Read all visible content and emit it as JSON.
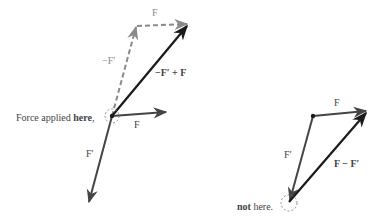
{
  "diagram": {
    "colors": {
      "black_arrow": "#1a1a1a",
      "dark_arrow": "#444444",
      "dashed_arrow": "#8a8a8a",
      "text": "#333333"
    },
    "left": {
      "caption_prefix": "Force applied ",
      "caption_bold": "here",
      "caption_suffix": ",",
      "labels": {
        "dashed_F": "F",
        "dashed_negFprime": "−F′",
        "sum": "−F′ + F",
        "F": "F",
        "Fprime": "F′"
      }
    },
    "right": {
      "caption_bold": "not",
      "caption_suffix": " here.",
      "labels": {
        "F": "F",
        "Fprime": "F′",
        "difference": "F − F′"
      }
    }
  }
}
